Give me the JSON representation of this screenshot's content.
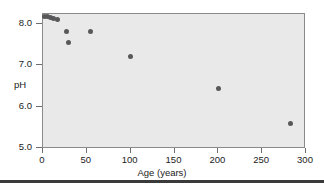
{
  "chart_data": {
    "type": "scatter",
    "title": "",
    "xlabel": "Age (years)",
    "ylabel": "pH",
    "xlim": [
      0,
      300
    ],
    "ylim": [
      5.0,
      8.4
    ],
    "grid": false,
    "legend": null,
    "xticks": [
      "0",
      "50",
      "100",
      "150",
      "200",
      "250",
      "300"
    ],
    "xtick_values": [
      0,
      50,
      100,
      150,
      200,
      250,
      300
    ],
    "yticks": [
      "5.0",
      "6.0",
      "7.0",
      "8.0"
    ],
    "ytick_values": [
      5.0,
      6.0,
      7.0,
      8.0
    ],
    "marker_color": "#58585a",
    "plot_background": "#e9e9e9",
    "frame_color": "#8a8a8a",
    "series": [
      {
        "name": "pH vs Age",
        "x": [
          2,
          5,
          8,
          12,
          16,
          27,
          29,
          54,
          100,
          200,
          282
        ],
        "y": [
          8.18,
          8.18,
          8.16,
          8.13,
          8.1,
          7.82,
          7.55,
          7.82,
          7.21,
          6.45,
          5.6
        ]
      }
    ]
  }
}
